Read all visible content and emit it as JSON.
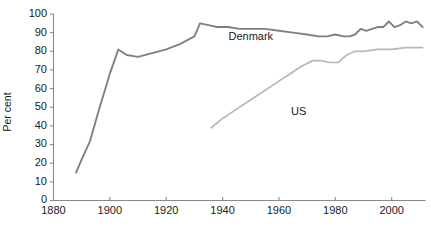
{
  "chart_data": {
    "type": "line",
    "title": "",
    "xlabel": "",
    "ylabel": "Per cent",
    "xlim": [
      1880,
      2012
    ],
    "ylim": [
      0,
      100
    ],
    "xticks": [
      1880,
      1900,
      1920,
      1940,
      1960,
      1980,
      2000
    ],
    "yticks": [
      0,
      10,
      20,
      30,
      40,
      50,
      60,
      70,
      80,
      90,
      100
    ],
    "grid": false,
    "legend_position": "inline-annotation",
    "series": [
      {
        "name": "Denmark",
        "color": "#808080",
        "label_x": 1950,
        "label_y": 86,
        "x": [
          1888,
          1890,
          1893,
          1896,
          1900,
          1903,
          1906,
          1910,
          1915,
          1920,
          1925,
          1930,
          1932,
          1935,
          1938,
          1942,
          1946,
          1950,
          1955,
          1960,
          1965,
          1970,
          1974,
          1977,
          1980,
          1983,
          1985,
          1987,
          1989,
          1991,
          1993,
          1995,
          1997,
          1999,
          2001,
          2003,
          2005,
          2007,
          2009,
          2011
        ],
        "y": [
          15,
          22,
          32,
          48,
          68,
          81,
          78,
          77,
          79,
          81,
          84,
          88,
          95,
          94,
          93,
          93,
          92,
          92,
          92,
          91,
          90,
          89,
          88,
          88,
          89,
          88,
          88,
          89,
          92,
          91,
          92,
          93,
          93,
          96,
          93,
          94,
          96,
          95,
          96,
          93
        ],
        "label": "Denmark"
      },
      {
        "name": "US",
        "color": "#b8b8b8",
        "label_x": 1967,
        "label_y": 46,
        "x": [
          1936,
          1940,
          1945,
          1950,
          1955,
          1960,
          1964,
          1968,
          1972,
          1975,
          1978,
          1981,
          1984,
          1987,
          1990,
          1995,
          2000,
          2005,
          2009,
          2011
        ],
        "y": [
          39,
          44,
          49,
          54,
          59,
          64,
          68,
          72,
          75,
          75,
          74,
          74,
          78,
          80,
          80,
          81,
          81,
          82,
          82,
          82
        ],
        "label": "US"
      }
    ]
  },
  "axis": {
    "y_title": "Per cent"
  }
}
